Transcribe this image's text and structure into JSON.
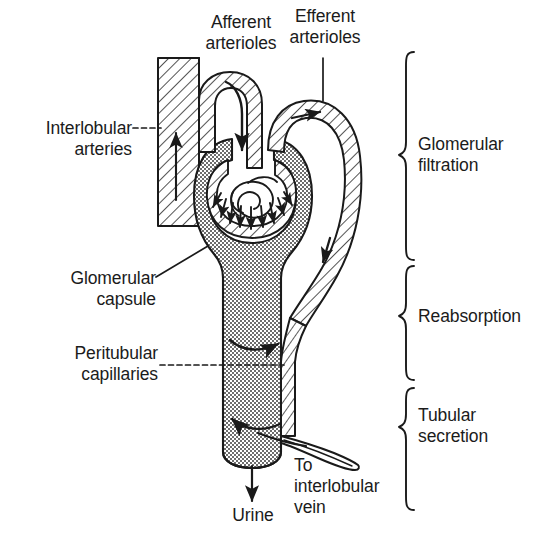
{
  "figure": {
    "type": "anatomical-line-diagram",
    "background_color": "#ffffff",
    "ink_color": "#1a1a1a",
    "fill_tones": {
      "stipple_capsule_tubule": "#b9b9b9",
      "hatched_vessel": "#ffffff"
    }
  },
  "labels": {
    "interlobular_arteries": "Interlobular\narteries",
    "afferent_arterioles": "Afferent\narterioles",
    "efferent_arterioles": "Efferent\narterioles",
    "glomerular_capsule": "Glomerular\ncapsule",
    "peritubular_capillaries": "Peritubular\ncapillaries",
    "to_interlobular_vein": "To\ninterlobular\nvein",
    "urine": "Urine"
  },
  "brace_labels": [
    {
      "id": "glomerular-filtration",
      "text": "Glomerular\nfiltration"
    },
    {
      "id": "reabsorption",
      "text": "Reabsorption"
    },
    {
      "id": "tubular-secretion",
      "text": "Tubular\nsecretion"
    }
  ],
  "structures": [
    "interlobular-artery",
    "afferent-arteriole",
    "glomerulus",
    "efferent-arteriole",
    "glomerular-capsule",
    "renal-tubule",
    "peritubular-capillary",
    "interlobular-vein",
    "urine-outflow"
  ],
  "flow_arrows": [
    {
      "id": "interlobular-artery-flow",
      "direction": "up"
    },
    {
      "id": "afferent-inflow",
      "direction": "down-right"
    },
    {
      "id": "efferent-outflow",
      "direction": "right"
    },
    {
      "id": "filtration-arrows",
      "direction": "radial-outward",
      "count": 9
    },
    {
      "id": "reabsorption-arrow",
      "direction": "right"
    },
    {
      "id": "secretion-arrow",
      "direction": "left"
    },
    {
      "id": "vein-flow",
      "direction": "down-right"
    },
    {
      "id": "urine-arrow",
      "direction": "down"
    }
  ]
}
